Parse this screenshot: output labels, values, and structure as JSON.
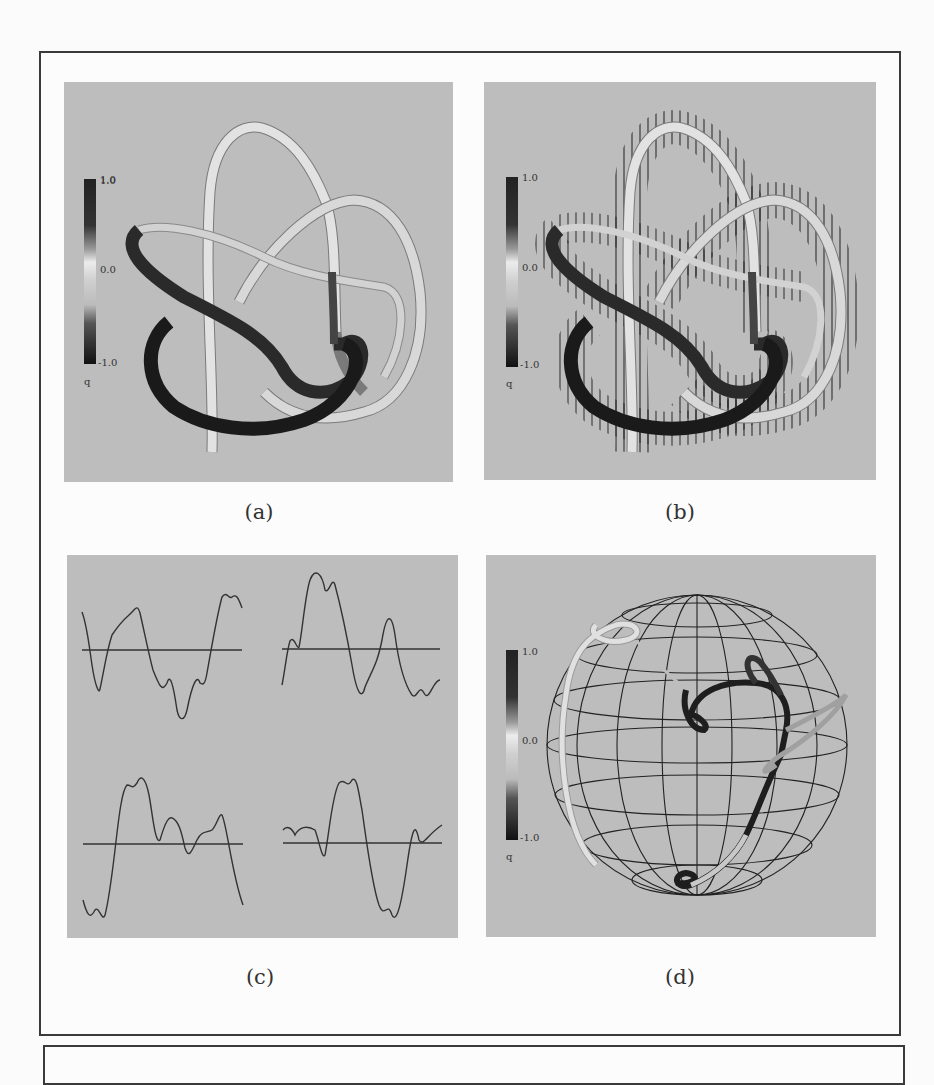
{
  "figure": {
    "panels": [
      {
        "id": "a",
        "caption": "(a)",
        "description": "Knotted tube colored by q"
      },
      {
        "id": "b",
        "caption": "(b)",
        "description": "Knotted tube colored by q with normal vector ticks"
      },
      {
        "id": "c",
        "caption": "(c)",
        "description": "Four oscillating profile curves with baselines"
      },
      {
        "id": "d",
        "caption": "(d)",
        "description": "Tube curve on wireframe sphere colored by q"
      }
    ],
    "colorbar": {
      "max_label": "1.0",
      "mid_label": "0.0",
      "min_label": "-1.0",
      "variable": "q"
    },
    "colors": {
      "panel_bg": "#bdbdbd",
      "frame": "#3a3a3a",
      "page_bg": "#fbfbfb",
      "tube_dark": "#1e1e1e",
      "tube_light": "#e4e4e4"
    }
  }
}
